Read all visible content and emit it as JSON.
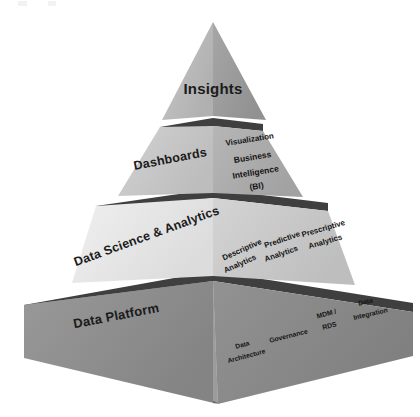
{
  "diagram": {
    "type": "pyramid",
    "shape": "3d-pyramid",
    "background_color": "#ffffff",
    "tiers": [
      {
        "id": "insights",
        "level": 1,
        "position": "apex",
        "left_face_label": "Insights",
        "left_face_color": "#b9b9b9",
        "right_face_color": "#9d9d9d",
        "right_face_items": []
      },
      {
        "id": "dashboards",
        "level": 2,
        "position": "second",
        "left_face_label": "Dashboards",
        "left_face_color": "#c6c6c6",
        "right_face_color": "#acacac",
        "right_face_items": [
          "Visualization",
          "Business",
          "Intelligence",
          "(BI)"
        ]
      },
      {
        "id": "data-science-analytics",
        "level": 3,
        "position": "third",
        "left_face_label": "Data Science & Analytics",
        "left_face_color": "#e7e7e7",
        "right_face_color": "#c9c9c9",
        "right_face_items": [
          "Descriptive Analytics",
          "Predictive Analytics",
          "Prescriptive Analytics"
        ]
      },
      {
        "id": "data-platform",
        "level": 4,
        "position": "base",
        "left_face_label": "Data Platform",
        "left_face_color": "#8d8d8d",
        "right_face_color": "#8a8a8a",
        "right_face_items": [
          "Data Architecture",
          "Governance",
          "MDM / RDS",
          "Data Integration"
        ]
      }
    ],
    "band_color": "#3f3f3f",
    "text_color": "#1b1b1b",
    "labels": {
      "insights": "Insights",
      "dashboards": "Dashboards",
      "visualization": "Visualization",
      "business": "Business",
      "intelligence": "Intelligence",
      "bi": "(BI)",
      "data_science_analytics": "Data Science & Analytics",
      "descriptive_1": "Descriptive",
      "descriptive_2": "Analytics",
      "predictive_1": "Predictive",
      "predictive_2": "Analytics",
      "prescriptive_1": "Prescriptive",
      "prescriptive_2": "Analytics",
      "data_platform": "Data Platform",
      "data_arch_1": "Data",
      "data_arch_2": "Architecture",
      "governance": "Governance",
      "mdm_1": "MDM /",
      "mdm_2": "RDS",
      "integration_1": "Data",
      "integration_2": "Integration"
    }
  }
}
